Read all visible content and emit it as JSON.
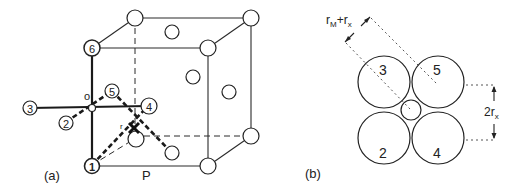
{
  "panel_a": {
    "label": "(a)",
    "origin_label": "o",
    "edge_label": "P",
    "radius_label": "r",
    "octahedron_sites": [
      {
        "id": "1",
        "label": "1"
      },
      {
        "id": "2",
        "label": "2"
      },
      {
        "id": "3",
        "label": "3"
      },
      {
        "id": "4",
        "label": "4"
      },
      {
        "id": "5",
        "label": "5"
      },
      {
        "id": "6",
        "label": "6"
      }
    ]
  },
  "panel_b": {
    "label": "(b)",
    "distance_label_main": "r",
    "distance_label_sub1": "M",
    "distance_label_plus": "+r",
    "distance_label_sub2": "x",
    "height_label_main": "2r",
    "height_label_sub": "x",
    "anions": [
      {
        "id": "3",
        "label": "3"
      },
      {
        "id": "5",
        "label": "5"
      },
      {
        "id": "2",
        "label": "2"
      },
      {
        "id": "4",
        "label": "4"
      }
    ]
  },
  "colors": {
    "line": "#222222",
    "background": "#ffffff"
  }
}
